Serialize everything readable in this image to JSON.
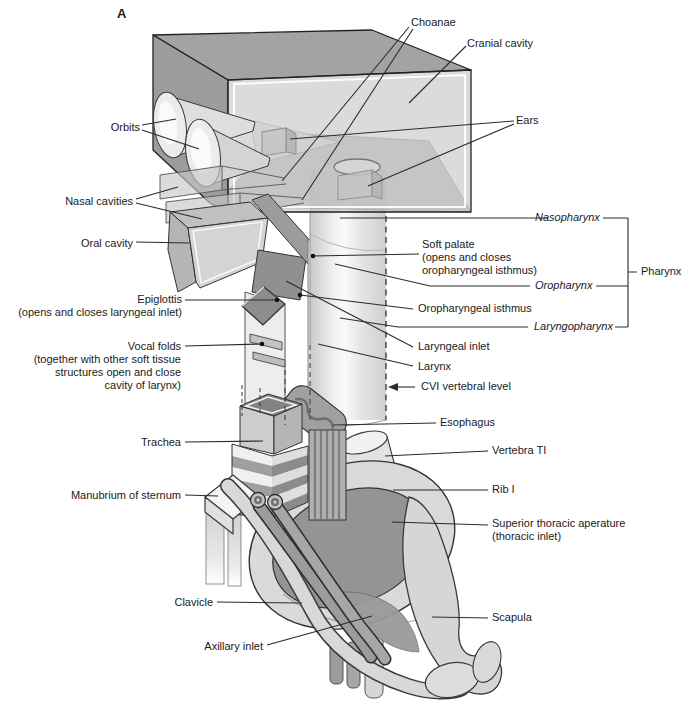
{
  "figure": {
    "panel_label": "A",
    "type": "anatomical schematic diagram"
  },
  "labels": {
    "choanae": "Choanae",
    "cranial_cavity": "Cranial cavity",
    "orbits": "Orbits",
    "ears": "Ears",
    "nasal_cavities": "Nasal cavities",
    "oral_cavity": "Oral cavity",
    "nasopharynx": "Nasopharynx",
    "soft_palate": [
      "Soft palate",
      "(opens and closes",
      "oropharyngeal isthmus)"
    ],
    "pharynx": "Pharynx",
    "oropharynx": "Oropharynx",
    "epiglottis": [
      "Epiglottis",
      "(opens and closes laryngeal inlet)"
    ],
    "oropharyngeal_isthmus": "Oropharyngeal isthmus",
    "laryngopharynx": "Laryngopharynx",
    "vocal_folds": [
      "Vocal folds",
      "(together with other soft tissue",
      "structures open and close",
      "cavity of larynx)"
    ],
    "laryngeal_inlet": "Laryngeal inlet",
    "larynx": "Larynx",
    "cvi_level": "CVI vertebral level",
    "esophagus": "Esophagus",
    "trachea": "Trachea",
    "vertebra_t1": "Vertebra TI",
    "manubrium": "Manubrium of sternum",
    "rib_1": "Rib I",
    "superior_thoracic_aperture": [
      "Superior thoracic aperature",
      "(thoracic inlet)"
    ],
    "clavicle": "Clavicle",
    "scapula": "Scapula",
    "axillary_inlet": "Axillary inlet"
  },
  "colors": {
    "background": "#ffffff",
    "line": "#2b2b2b",
    "box_top_gray": "#a3a3a3",
    "box_front_gray": "#b8b8b8",
    "light_gray": "#d8d8d8",
    "dark_gray": "#8e8e8e",
    "aperture_gray": "#949494",
    "highlight_white": "#ffffff"
  }
}
